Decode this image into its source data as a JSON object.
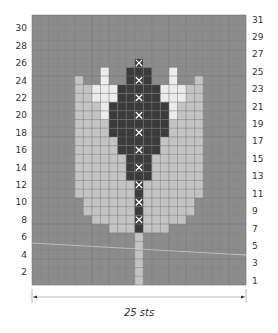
{
  "chart_data": {
    "type": "heatmap",
    "title": "",
    "stitch_count_label": "25 sts",
    "columns": 25,
    "rows": 31,
    "row_numbers_left": [
      30,
      28,
      26,
      24,
      22,
      20,
      18,
      16,
      14,
      12,
      10,
      8,
      6,
      4,
      2
    ],
    "row_numbers_right": [
      31,
      29,
      27,
      25,
      23,
      21,
      19,
      17,
      15,
      13,
      11,
      9,
      7,
      5,
      3,
      1
    ],
    "colors": {
      "background": "#8c8c8c",
      "light": "#c3c3c3",
      "white": "#ececec",
      "dark": "#3b3b3b",
      "gridline": "#6f6f6f",
      "x_mark": "#ffffff"
    },
    "legend_symbols": {
      "B": "background",
      "L": "light",
      "W": "white",
      "D": "dark"
    },
    "runs_by_row": {
      "26": [
        [
          "D",
          13,
          13
        ]
      ],
      "25": [
        [
          "W",
          9,
          9
        ],
        [
          "D",
          12,
          14
        ],
        [
          "W",
          17,
          17
        ]
      ],
      "24": [
        [
          "L",
          6,
          6
        ],
        [
          "W",
          9,
          9
        ],
        [
          "D",
          12,
          14
        ],
        [
          "W",
          17,
          17
        ],
        [
          "L",
          20,
          20
        ]
      ],
      "23": [
        [
          "L",
          6,
          7
        ],
        [
          "W",
          8,
          10
        ],
        [
          "D",
          11,
          15
        ],
        [
          "W",
          16,
          18
        ],
        [
          "L",
          19,
          20
        ]
      ],
      "22": [
        [
          "L",
          6,
          7
        ],
        [
          "W",
          8,
          10
        ],
        [
          "D",
          11,
          15
        ],
        [
          "W",
          16,
          18
        ],
        [
          "L",
          19,
          20
        ]
      ],
      "21": [
        [
          "L",
          6,
          8
        ],
        [
          "W",
          9,
          9
        ],
        [
          "D",
          10,
          16
        ],
        [
          "W",
          17,
          17
        ],
        [
          "L",
          18,
          20
        ]
      ],
      "20": [
        [
          "L",
          6,
          8
        ],
        [
          "W",
          9,
          9
        ],
        [
          "D",
          10,
          16
        ],
        [
          "W",
          17,
          17
        ],
        [
          "L",
          18,
          20
        ]
      ],
      "19": [
        [
          "L",
          6,
          9
        ],
        [
          "D",
          10,
          16
        ],
        [
          "L",
          17,
          20
        ]
      ],
      "18": [
        [
          "L",
          6,
          9
        ],
        [
          "D",
          10,
          16
        ],
        [
          "L",
          17,
          20
        ]
      ],
      "17": [
        [
          "L",
          6,
          10
        ],
        [
          "D",
          11,
          15
        ],
        [
          "L",
          16,
          20
        ]
      ],
      "16": [
        [
          "L",
          6,
          10
        ],
        [
          "D",
          11,
          15
        ],
        [
          "L",
          16,
          20
        ]
      ],
      "15": [
        [
          "L",
          6,
          11
        ],
        [
          "D",
          12,
          14
        ],
        [
          "L",
          15,
          20
        ]
      ],
      "14": [
        [
          "L",
          6,
          11
        ],
        [
          "D",
          12,
          14
        ],
        [
          "L",
          15,
          20
        ]
      ],
      "13": [
        [
          "L",
          6,
          11
        ],
        [
          "D",
          12,
          14
        ],
        [
          "L",
          15,
          20
        ]
      ],
      "12": [
        [
          "L",
          6,
          12
        ],
        [
          "D",
          13,
          13
        ],
        [
          "L",
          14,
          20
        ]
      ],
      "11": [
        [
          "L",
          6,
          12
        ],
        [
          "D",
          13,
          13
        ],
        [
          "L",
          14,
          20
        ]
      ],
      "10": [
        [
          "L",
          7,
          12
        ],
        [
          "D",
          13,
          13
        ],
        [
          "L",
          14,
          19
        ]
      ],
      "9": [
        [
          "L",
          7,
          12
        ],
        [
          "D",
          13,
          13
        ],
        [
          "L",
          14,
          19
        ]
      ],
      "8": [
        [
          "L",
          8,
          12
        ],
        [
          "D",
          13,
          13
        ],
        [
          "L",
          14,
          18
        ]
      ],
      "7": [
        [
          "L",
          10,
          12
        ],
        [
          "D",
          13,
          13
        ],
        [
          "L",
          14,
          16
        ]
      ],
      "6": [
        [
          "L",
          13,
          13
        ]
      ],
      "5": [
        [
          "L",
          13,
          13
        ]
      ],
      "4": [
        [
          "L",
          13,
          13
        ]
      ],
      "3": [
        [
          "L",
          13,
          13
        ]
      ],
      "2": [
        [
          "L",
          13,
          13
        ]
      ],
      "1": [
        [
          "L",
          13,
          13
        ]
      ]
    },
    "x_marks": {
      "column": 13,
      "rows": [
        26,
        24,
        22,
        20,
        18,
        16,
        14,
        12,
        10,
        8
      ]
    }
  }
}
